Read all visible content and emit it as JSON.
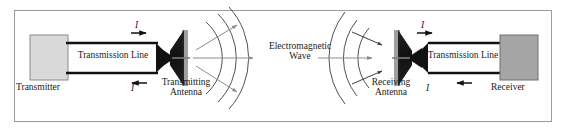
{
  "figure": {
    "kind": "block-diagram",
    "frame_color": "#9b9b9b",
    "background_color": "#ffffff",
    "line_color": "#111111",
    "wave_color": "#3d3d3d",
    "ray_color": "#8c8c8c"
  },
  "blocks": {
    "transmitter": {
      "label": "Transmitter",
      "fill": "#d9d9d9",
      "stroke": "#8a8a8a"
    },
    "receiver": {
      "label": "Receiver",
      "fill": "#a6a6a6",
      "stroke": "#6f6f6f"
    }
  },
  "transmission_lines": {
    "left_label": "Transmission Line",
    "right_label": "Transmission Line"
  },
  "antennas": {
    "transmitting": {
      "line1": "Transmitting",
      "line2": "Antenna",
      "fill": "#111111"
    },
    "receiving": {
      "line1": "Receiving",
      "line2": "Antenna",
      "fill": "#111111"
    }
  },
  "wave": {
    "line1": "Electromagnetic",
    "line2": "Wave",
    "arc_count_transmit": 3,
    "arc_count_receive": 3
  },
  "currents": {
    "tx_top_symbol": "I",
    "tx_top_direction": "right",
    "tx_bottom_symbol": "I",
    "tx_bottom_direction": "left",
    "rx_top_symbol": "I",
    "rx_top_direction": "right",
    "rx_bottom_symbol": "I",
    "rx_bottom_direction": "left"
  }
}
